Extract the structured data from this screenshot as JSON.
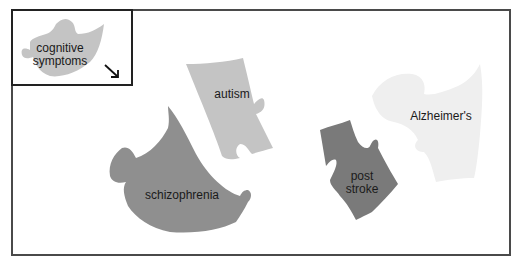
{
  "legend": {
    "label_line1": "cognitive",
    "label_line2": "symptoms",
    "arrow": "arrow-down-right-icon",
    "color": "#c4c4c4"
  },
  "pieces": {
    "autism": {
      "label": "autism",
      "color": "#c4c4c4"
    },
    "schizophrenia": {
      "label": "schizophrenia",
      "color": "#8f8f8f"
    },
    "post_stroke": {
      "label_line1": "post",
      "label_line2": "stroke",
      "color": "#7a7a7a"
    },
    "alzheimers": {
      "label": "Alzheimer's",
      "color": "#efefef"
    }
  }
}
